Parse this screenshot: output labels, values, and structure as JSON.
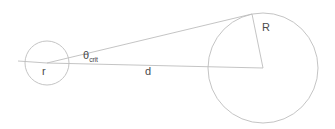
{
  "figure": {
    "name": "critical-angle-geometry",
    "background_color": "#ffffff",
    "stroke_color": "#bdbdbd",
    "label_color": "#4a4a4a",
    "width": 335,
    "height": 129
  },
  "labels": {
    "small_radius": "r",
    "angle_symbol": "θ",
    "angle_subscript": "crit",
    "distance": "d",
    "large_radius": "R"
  },
  "geometry": {
    "small_circle": {
      "cx": 47,
      "cy": 63,
      "r": 22
    },
    "large_circle": {
      "cx": 263,
      "cy": 68,
      "r": 55
    },
    "center_line": {
      "x1": 47,
      "y1": 63,
      "x2": 263,
      "y2": 68
    },
    "tangent_line": {
      "x1": 47,
      "y1": 63,
      "x2": 252,
      "y2": 14
    },
    "upper_chord": {
      "x1": 252,
      "y1": 14,
      "x2": 263,
      "y2": 68
    },
    "left_tick": {
      "x1": 18,
      "y1": 61,
      "x2": 47,
      "y2": 63
    }
  }
}
